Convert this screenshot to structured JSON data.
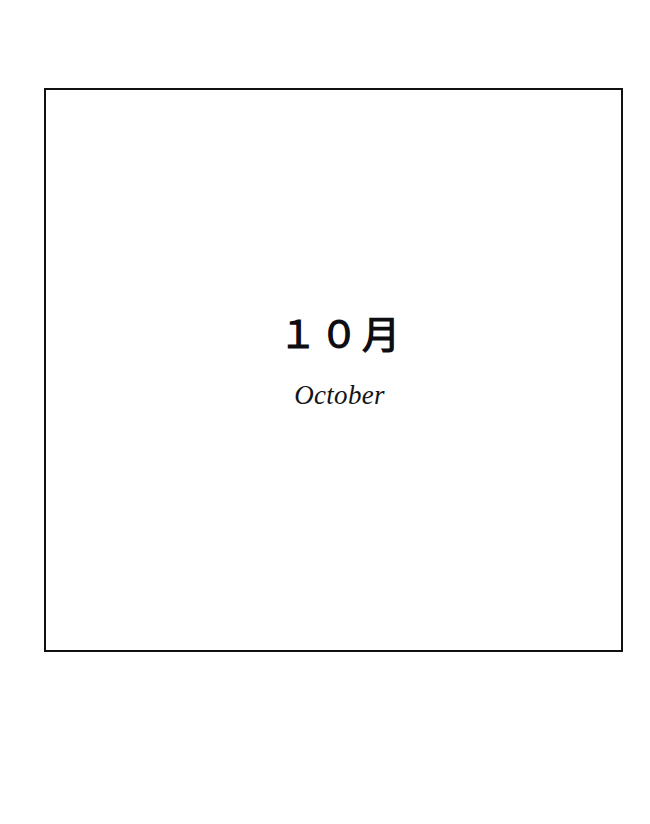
{
  "page": {
    "background_color": "#ffffff",
    "width": 650,
    "height": 824
  },
  "frame": {
    "name": "month-divider-frame",
    "border_color": "#111111",
    "border_width_px": 2,
    "fill_color": "#ffffff"
  },
  "month": {
    "japanese_label": "１０月",
    "english_label": "October",
    "number": "10",
    "text_color": "#0d0d12"
  }
}
